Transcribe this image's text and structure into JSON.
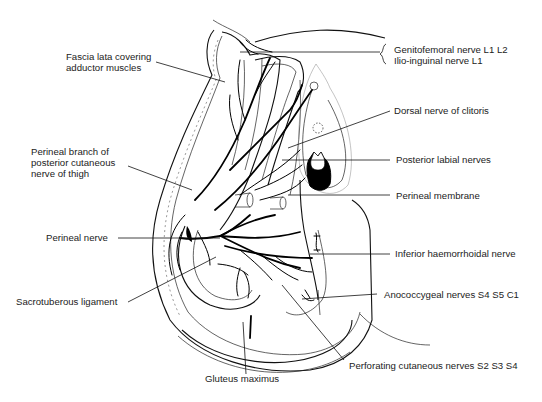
{
  "figure": {
    "labels": {
      "fascia_lata": "Fascia lata covering\nadductor muscles",
      "genitofemoral": "Genitofemoral nerve L1 L2",
      "ilioinguinal": "Ilio-inguinal nerve L1",
      "dorsal_nerve_clitoris": "Dorsal nerve of clitoris",
      "perineal_branch": "Perineal branch of\nposterior cutaneous\nnerve of thigh",
      "posterior_labial": "Posterior labial nerves",
      "perineal_membrane": "Perineal membrane",
      "perineal_nerve": "Perineal nerve",
      "inferior_haemorrhoidal": "Inferior haemorrhoidal nerve",
      "sacrotuberous": "Sacrotuberous ligament",
      "anococcygeal": "Anococcygeal nerves S4 S5 C1",
      "perforating_cutaneous": "Perforating cutaneous nerves S2 S3 S4",
      "gluteus_maximus": "Gluteus maximus"
    }
  }
}
